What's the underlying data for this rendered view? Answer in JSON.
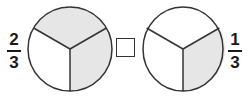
{
  "left": {
    "fraction": {
      "numerator": "2",
      "denominator": "3"
    },
    "circle": {
      "parts": 3,
      "shaded": 2,
      "shaded_color": "#e6e6e6",
      "stroke_color": "#333333"
    }
  },
  "comparison_box": {
    "value": ""
  },
  "right": {
    "fraction": {
      "numerator": "1",
      "denominator": "3"
    },
    "circle": {
      "parts": 3,
      "shaded": 1,
      "shaded_color": "#e6e6e6",
      "stroke_color": "#333333"
    }
  }
}
